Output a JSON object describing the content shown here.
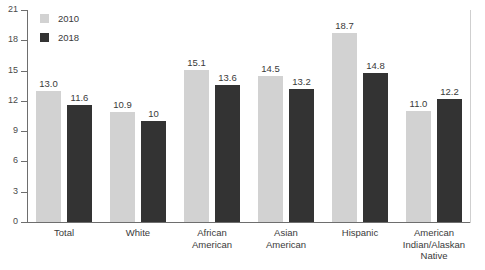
{
  "chart_data": {
    "type": "bar",
    "title": "",
    "subtitle": "",
    "xlabel": "",
    "ylabel": "",
    "ylim": [
      0,
      21
    ],
    "yticks": [
      0,
      3,
      6,
      9,
      12,
      15,
      18,
      21
    ],
    "grid": false,
    "legend_position": "top-left",
    "categories": [
      "Total",
      "White",
      "African American",
      "Asian American",
      "Hispanic",
      "American Indian/Alaskan Native"
    ],
    "category_lines": [
      [
        "Total"
      ],
      [
        "White"
      ],
      [
        "African",
        "American"
      ],
      [
        "Asian",
        "American"
      ],
      [
        "Hispanic"
      ],
      [
        "American",
        "Indian/Alaskan",
        "Native"
      ]
    ],
    "series": [
      {
        "name": "2010",
        "color": "#d2d2d2",
        "values": [
          13.0,
          10.9,
          15.1,
          14.5,
          18.7,
          11.0
        ],
        "labels": [
          "13.0",
          "10.9",
          "15.1",
          "14.5",
          "18.7",
          "11.0"
        ]
      },
      {
        "name": "2018",
        "color": "#333333",
        "values": [
          11.6,
          10.0,
          13.6,
          13.2,
          14.8,
          12.2
        ],
        "labels": [
          "11.6",
          "10",
          "13.6",
          "13.2",
          "14.8",
          "12.2"
        ]
      }
    ]
  },
  "legend": {
    "items": [
      {
        "label": "2010",
        "color": "#d2d2d2"
      },
      {
        "label": "2018",
        "color": "#333333"
      }
    ]
  },
  "axis": {
    "y_tick_labels": [
      "21",
      "18",
      "15",
      "12",
      "9",
      "6",
      "3",
      "0"
    ]
  },
  "colors": {
    "series_2010": "#d2d2d2",
    "series_2018": "#333333",
    "axis_line": "#6e6e6e",
    "frame_right": "#cfcfcf",
    "text": "#3a3a3a",
    "background": "#ffffff"
  }
}
